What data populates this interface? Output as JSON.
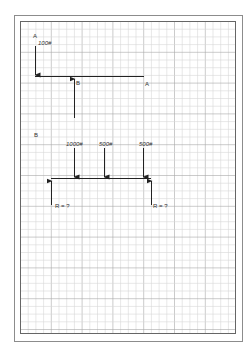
{
  "diagram": {
    "type": "free-body beam diagrams on graph paper",
    "part_a": {
      "section_label": "A",
      "load_label": "100#",
      "support_label_b": "B",
      "end_label_a": "A"
    },
    "part_b": {
      "section_label": "B",
      "loads": [
        {
          "label": "1000#"
        },
        {
          "label": "500#"
        },
        {
          "label": "500#"
        }
      ],
      "reactions": [
        {
          "label": "R = ?"
        },
        {
          "label": "R = ?"
        }
      ]
    },
    "colors": {
      "grid_minor": "#d6d6d6",
      "grid_major": "#a8a8a8",
      "frame": "#8c8c8c",
      "ink": "#222222"
    }
  }
}
